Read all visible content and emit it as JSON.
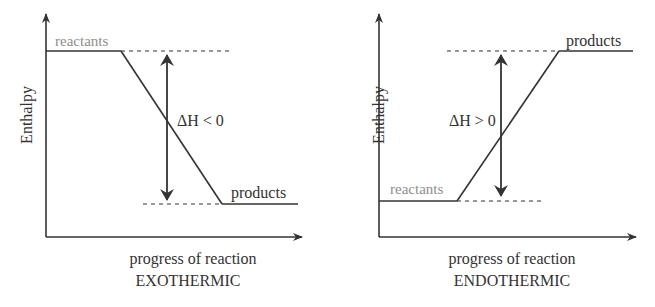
{
  "colors": {
    "line": "#333333",
    "reactants_label": "#8e8e8e",
    "text": "#333333",
    "background": "#ffffff"
  },
  "diagrams": [
    {
      "id": "exothermic",
      "y_axis_label": "Enthalpy",
      "x_axis_label": "progress of reaction",
      "caption": "EXOTHERMIC",
      "reactants_label": "reactants",
      "products_label": "products",
      "delta_h_label": "ΔH < 0",
      "reactants_level": "high",
      "products_level": "low"
    },
    {
      "id": "endothermic",
      "y_axis_label": "Enthalpy",
      "x_axis_label": "progress of reaction",
      "caption": "ENDOTHERMIC",
      "reactants_label": "reactants",
      "products_label": "products",
      "delta_h_label": "ΔH > 0",
      "reactants_level": "low",
      "products_level": "high"
    }
  ]
}
